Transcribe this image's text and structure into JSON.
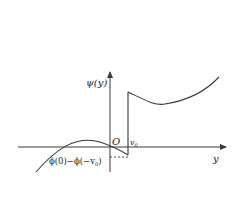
{
  "diagram": {
    "type": "function-graph",
    "colors": {
      "line": "#3a3a3a",
      "background": "#ffffff"
    },
    "axes": {
      "vertical_label": "ψ(y)",
      "horizontal_label": "y",
      "origin_label": "O"
    },
    "markers": {
      "jump_point_label": "v",
      "jump_point_subscript": "0",
      "gap_label_prefix": "ϕ(0)−ϕ(−v",
      "gap_label_subscript": "0",
      "gap_label_suffix": ")"
    }
  }
}
